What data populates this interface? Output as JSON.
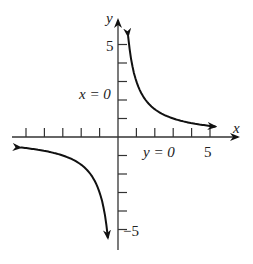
{
  "chart_data": {
    "type": "line",
    "title": "",
    "function": "y = 3/x",
    "xlabel": "x",
    "ylabel": "y",
    "xlim": [
      -6,
      6
    ],
    "ylim": [
      -6,
      6
    ],
    "grid": false,
    "x_ticks": [
      -5,
      -4,
      -3,
      -2,
      -1,
      1,
      2,
      3,
      4,
      5
    ],
    "y_ticks": [
      -5,
      -4,
      -3,
      -2,
      -1,
      1,
      2,
      3,
      4,
      5
    ],
    "tick_labels": {
      "x": [
        "5"
      ],
      "y": [
        "5",
        "−5"
      ]
    },
    "annotations": [
      {
        "text": "x = 0",
        "meaning": "vertical asymptote",
        "position": "left of y-axis near y=2.5"
      },
      {
        "text": "y = 0",
        "meaning": "horizontal asymptote",
        "position": "below x-axis near x=2.5"
      }
    ],
    "series": [
      {
        "name": "branch-positive",
        "x": [
          0.55,
          0.75,
          1,
          1.5,
          2,
          3,
          4,
          5.3
        ],
        "y": [
          5.45,
          4,
          3,
          2,
          1.5,
          1,
          0.75,
          0.57
        ]
      },
      {
        "name": "branch-negative",
        "x": [
          -5.3,
          -4,
          -3,
          -2,
          -1.5,
          -1,
          -0.75,
          -0.55
        ],
        "y": [
          -0.57,
          -0.75,
          -1,
          -1.5,
          -2,
          -3,
          -4,
          -5.45
        ]
      }
    ]
  },
  "labels": {
    "x_axis": "x",
    "y_axis": "y",
    "x_five": "5",
    "y_five": "5",
    "y_neg_five": "−5",
    "vert_asym": "x = 0",
    "horiz_asym": "y = 0"
  }
}
